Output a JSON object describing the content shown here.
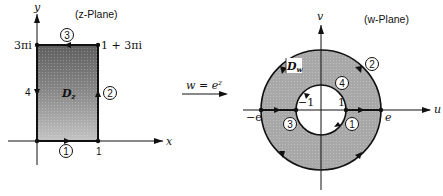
{
  "colors": {
    "ink": "#111111",
    "shade_dark": "#6e6e6e",
    "shade_light": "#b4b4b4",
    "annulus": "#a8a8a8",
    "background": "#ffffff"
  },
  "z_plane": {
    "title": "(z-Plane)",
    "x_axis_label": "x",
    "y_axis_label": "y",
    "region_label": "D",
    "region_subscript": "z",
    "corner_top_left": "3πi",
    "corner_top_right": "1 + 3πi",
    "x_tick_1": "1",
    "edge_labels": {
      "bottom": "1",
      "right": "2",
      "top": "3",
      "left": "4"
    }
  },
  "mapping": {
    "label_lhs": "w = e",
    "label_exp": "z"
  },
  "w_plane": {
    "title": "(w-Plane)",
    "u_axis_label": "u",
    "v_axis_label": "v",
    "region_label": "D",
    "region_subscript": "w",
    "tick_neg_e": "−e",
    "tick_neg_1": "−1",
    "tick_pos_1": "1",
    "tick_pos_e": "e",
    "curve_labels": {
      "inner_circle": "1",
      "outer_circle": "2",
      "neg_segment": "3",
      "pos_segment": "4"
    }
  }
}
